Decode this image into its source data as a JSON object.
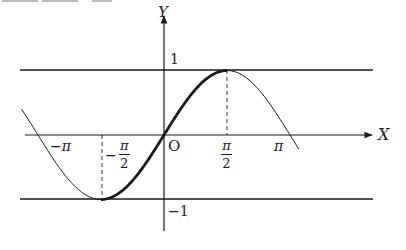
{
  "diagram": {
    "axes": {
      "x_label": "X",
      "y_label": "Y",
      "origin_label": "O"
    },
    "y_ticks": [
      {
        "value": 1,
        "label": "1"
      },
      {
        "value": -1,
        "label": "−1"
      }
    ],
    "x_ticks": [
      {
        "value": "-pi",
        "label_sign": "−",
        "label_num": "π",
        "label_den": ""
      },
      {
        "value": "-pi/2",
        "label_sign": "−",
        "label_num": "π",
        "label_den": "2"
      },
      {
        "value": "pi/2",
        "label_sign": "",
        "label_num": "π",
        "label_den": "2"
      },
      {
        "value": "pi",
        "label_sign": "",
        "label_num": "π",
        "label_den": ""
      }
    ],
    "horizontal_lines": [
      {
        "name": "y = 1",
        "y": 1
      },
      {
        "name": "y = -1",
        "y": -1
      }
    ],
    "curve": {
      "function": "sin(x)",
      "thin_domain": [
        "-1.13π",
        "1.07π"
      ],
      "thick_domain": [
        "-π/2",
        "π/2"
      ]
    },
    "dashed_guides": [
      {
        "x": "-π/2",
        "from_y": 0,
        "to_y": -1
      },
      {
        "x": "π/2",
        "from_y": 0,
        "to_y": 1
      }
    ],
    "colors": {
      "ink": "#1a1a1a",
      "background": "#ffffff"
    }
  }
}
